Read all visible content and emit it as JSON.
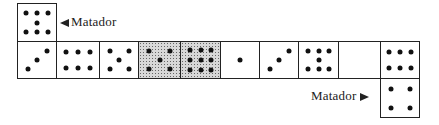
{
  "labels": {
    "top_matador": "Matador",
    "bottom_matador": "Matador"
  },
  "dominoes": {
    "top": {
      "pips": 7,
      "pattern": "seven",
      "shaded": false
    },
    "row": [
      {
        "pips": 3,
        "pattern": "three",
        "shaded": false
      },
      {
        "pips": 6,
        "pattern": "six-horizontal",
        "shaded": false
      },
      {
        "pips": 5,
        "pattern": "five",
        "shaded": false
      },
      {
        "pips": 5,
        "pattern": "five",
        "shaded": true
      },
      {
        "pips": 9,
        "pattern": "nine",
        "shaded": true
      },
      {
        "pips": 1,
        "pattern": "one",
        "shaded": false
      },
      {
        "pips": 3,
        "pattern": "three",
        "shaded": false
      },
      {
        "pips": 7,
        "pattern": "seven",
        "shaded": false
      },
      {
        "pips": 0,
        "pattern": "blank",
        "shaded": false
      },
      {
        "pips": 6,
        "pattern": "six-horizontal",
        "shaded": false
      }
    ],
    "bottom": {
      "pips": 4,
      "pattern": "four",
      "shaded": false
    }
  }
}
